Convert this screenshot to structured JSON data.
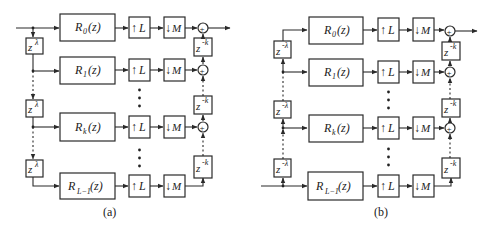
{
  "figures": [
    {
      "id": "a",
      "caption": "(a)",
      "delay_label": "z",
      "delay_exp": "λ",
      "feedback_label": "z",
      "feedback_exp": "-k",
      "branches": [
        {
          "filter": "R",
          "sub": "0",
          "arg": "(z)"
        },
        {
          "filter": "R",
          "sub": "1",
          "arg": "(z)"
        },
        {
          "filter": "R",
          "sub": "k",
          "arg": "(z)"
        },
        {
          "filter": "R",
          "sub": "L−1",
          "arg": "(z)"
        }
      ],
      "upsampler": "↑L",
      "downsampler": "↓M"
    },
    {
      "id": "b",
      "caption": "(b)",
      "delay_label": "z",
      "delay_exp": "-λ",
      "feedback_label": "z",
      "feedback_exp": "-k",
      "branches": [
        {
          "filter": "R",
          "sub": "0",
          "arg": "(z)"
        },
        {
          "filter": "R",
          "sub": "1",
          "arg": "(z)"
        },
        {
          "filter": "R",
          "sub": "k",
          "arg": "(z)"
        },
        {
          "filter": "R",
          "sub": "L−1",
          "arg": "(z)"
        }
      ],
      "upsampler": "↑L",
      "downsampler": "↓M"
    }
  ],
  "up_arrow": "↑",
  "down_arrow": "↓",
  "L": "L",
  "M": "M",
  "plus": "+"
}
